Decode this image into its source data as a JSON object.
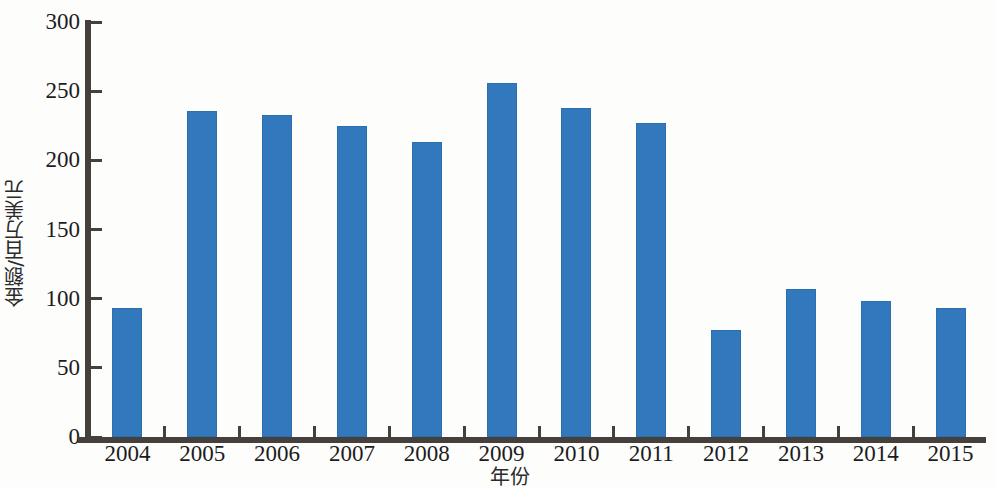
{
  "chart_data": {
    "type": "bar",
    "title": "",
    "subtitle": "",
    "xlabel": "年份",
    "ylabel": "金额/百万美元",
    "categories": [
      "2004",
      "2005",
      "2006",
      "2007",
      "2008",
      "2009",
      "2010",
      "2011",
      "2012",
      "2013",
      "2014",
      "2015"
    ],
    "values": [
      93,
      236,
      233,
      225,
      213,
      256,
      238,
      227,
      77,
      107,
      98,
      93
    ],
    "series": [
      {
        "name": "金额",
        "values": [
          93,
          236,
          233,
          225,
          213,
          256,
          238,
          227,
          77,
          107,
          98,
          93
        ]
      }
    ],
    "ylim": [
      0,
      300
    ],
    "ytick_step": 50,
    "ytick_labels": [
      "0",
      "50",
      "100",
      "150",
      "200",
      "250",
      "300"
    ],
    "xtick_labels": [
      "2004",
      "2005",
      "2006",
      "2007",
      "2008",
      "2009",
      "2010",
      "2011",
      "2012",
      "2013",
      "2014",
      "2015"
    ],
    "grid": false,
    "legend": false,
    "legend_position": "none",
    "annotations": [],
    "colors": {
      "bar": "#3179bc",
      "axis": "#45403c",
      "text": "#1c1c1c",
      "background": "#fdfdfc"
    }
  }
}
